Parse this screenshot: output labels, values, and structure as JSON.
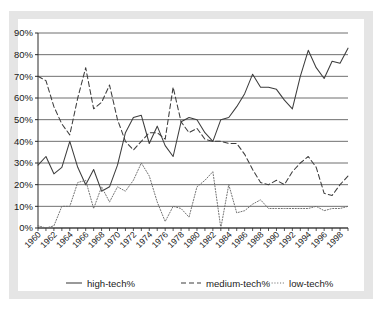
{
  "chart_data": {
    "type": "line",
    "title": "",
    "xlabel": "",
    "ylabel": "",
    "xlim": [
      1960,
      1999
    ],
    "ylim": [
      0,
      90
    ],
    "grid": true,
    "legend_position": "bottom",
    "ytick_labels": [
      "0%",
      "10%",
      "20%",
      "30%",
      "40%",
      "50%",
      "60%",
      "70%",
      "80%",
      "90%"
    ],
    "ytick_values": [
      0,
      10,
      20,
      30,
      40,
      50,
      60,
      70,
      80,
      90
    ],
    "xtick_labels": [
      "1960",
      "1962",
      "1964",
      "1966",
      "1968",
      "1970",
      "1972",
      "1974",
      "1976",
      "1978",
      "1980",
      "1982",
      "1984",
      "1986",
      "1988",
      "1990",
      "1992",
      "1994",
      "1996",
      "1998"
    ],
    "xtick_values": [
      1960,
      1962,
      1964,
      1966,
      1968,
      1970,
      1972,
      1974,
      1976,
      1978,
      1980,
      1982,
      1984,
      1986,
      1988,
      1990,
      1992,
      1994,
      1996,
      1998
    ],
    "x": [
      1960,
      1961,
      1962,
      1963,
      1964,
      1965,
      1966,
      1967,
      1968,
      1969,
      1970,
      1971,
      1972,
      1973,
      1974,
      1975,
      1976,
      1977,
      1978,
      1979,
      1980,
      1981,
      1982,
      1983,
      1984,
      1985,
      1986,
      1987,
      1988,
      1989,
      1990,
      1991,
      1992,
      1993,
      1994,
      1995,
      1996,
      1997,
      1998,
      1999
    ],
    "series": [
      {
        "name": "high-tech%",
        "style": "solid",
        "color": "#3d3d3d",
        "values": [
          29,
          33,
          25,
          28,
          40,
          28,
          20,
          27,
          17,
          19,
          29,
          44,
          51,
          52,
          39,
          47,
          38,
          49,
          51,
          50,
          44,
          40,
          33,
          33,
          45,
          51,
          51,
          52,
          61,
          71,
          65,
          65,
          65,
          64,
          59,
          55,
          82,
          74,
          69,
          77
        ]
      },
      {
        "name": "medium-tech%",
        "style": "dashed",
        "color": "#3d3d3d",
        "values": [
          70,
          71,
          66,
          49,
          42,
          44,
          74,
          62,
          55,
          67,
          58,
          43,
          40,
          45,
          36,
          41,
          39,
          45,
          46,
          41,
          45,
          65,
          51,
          49,
          45,
          42,
          44,
          41,
          42,
          40,
          40,
          40,
          39,
          40,
          27,
          20,
          20,
          19,
          21,
          25
        ]
      },
      {
        "name": "low-tech%",
        "style": "dotted",
        "color": "#6a6a6a",
        "values": [
          1,
          0,
          1,
          10,
          10,
          21,
          22,
          9,
          19,
          12,
          19,
          17,
          22,
          30,
          24,
          12,
          3,
          10,
          9,
          5,
          19,
          22,
          26,
          0,
          20,
          7,
          8,
          11,
          13,
          9,
          9,
          9,
          9,
          9,
          9,
          10,
          8,
          9,
          9,
          10
        ]
      }
    ],
    "series_full": {
      "high-tech%": [
        {
          "x": 1960,
          "y": 29
        },
        {
          "x": 1961,
          "y": 33
        },
        {
          "x": 1962,
          "y": 25
        },
        {
          "x": 1963,
          "y": 28
        },
        {
          "x": 1964,
          "y": 40
        },
        {
          "x": 1965,
          "y": 28
        },
        {
          "x": 1966,
          "y": 20
        },
        {
          "x": 1967,
          "y": 27
        },
        {
          "x": 1968,
          "y": 17
        },
        {
          "x": 1969,
          "y": 19
        },
        {
          "x": 1970,
          "y": 29
        },
        {
          "x": 1971,
          "y": 44
        },
        {
          "x": 1972,
          "y": 51
        },
        {
          "x": 1973,
          "y": 52
        },
        {
          "x": 1974,
          "y": 39
        },
        {
          "x": 1975,
          "y": 47
        },
        {
          "x": 1976,
          "y": 38
        },
        {
          "x": 1977,
          "y": 33
        },
        {
          "x": 1978,
          "y": 49
        },
        {
          "x": 1979,
          "y": 51
        },
        {
          "x": 1980,
          "y": 50
        },
        {
          "x": 1981,
          "y": 44
        },
        {
          "x": 1982,
          "y": 40
        },
        {
          "x": 1983,
          "y": 50
        },
        {
          "x": 1984,
          "y": 51
        },
        {
          "x": 1985,
          "y": 56
        },
        {
          "x": 1986,
          "y": 62
        },
        {
          "x": 1987,
          "y": 71
        },
        {
          "x": 1988,
          "y": 65
        },
        {
          "x": 1989,
          "y": 65
        },
        {
          "x": 1990,
          "y": 64
        },
        {
          "x": 1991,
          "y": 59
        },
        {
          "x": 1992,
          "y": 55
        },
        {
          "x": 1993,
          "y": 70
        },
        {
          "x": 1994,
          "y": 82
        },
        {
          "x": 1995,
          "y": 74
        },
        {
          "x": 1996,
          "y": 69
        },
        {
          "x": 1997,
          "y": 77
        },
        {
          "x": 1998,
          "y": 76
        },
        {
          "x": 1999,
          "y": 83
        }
      ],
      "medium-tech%": [
        {
          "x": 1960,
          "y": 70
        },
        {
          "x": 1961,
          "y": 68
        },
        {
          "x": 1962,
          "y": 56
        },
        {
          "x": 1963,
          "y": 48
        },
        {
          "x": 1964,
          "y": 43
        },
        {
          "x": 1965,
          "y": 60
        },
        {
          "x": 1966,
          "y": 74
        },
        {
          "x": 1967,
          "y": 55
        },
        {
          "x": 1968,
          "y": 58
        },
        {
          "x": 1969,
          "y": 66
        },
        {
          "x": 1970,
          "y": 50
        },
        {
          "x": 1971,
          "y": 40
        },
        {
          "x": 1972,
          "y": 36
        },
        {
          "x": 1973,
          "y": 40
        },
        {
          "x": 1974,
          "y": 44
        },
        {
          "x": 1975,
          "y": 44
        },
        {
          "x": 1976,
          "y": 41
        },
        {
          "x": 1977,
          "y": 65
        },
        {
          "x": 1978,
          "y": 49
        },
        {
          "x": 1979,
          "y": 44
        },
        {
          "x": 1980,
          "y": 46
        },
        {
          "x": 1981,
          "y": 41
        },
        {
          "x": 1982,
          "y": 40
        },
        {
          "x": 1983,
          "y": 40
        },
        {
          "x": 1984,
          "y": 39
        },
        {
          "x": 1985,
          "y": 39
        },
        {
          "x": 1986,
          "y": 34
        },
        {
          "x": 1987,
          "y": 27
        },
        {
          "x": 1988,
          "y": 21
        },
        {
          "x": 1989,
          "y": 20
        },
        {
          "x": 1990,
          "y": 22
        },
        {
          "x": 1991,
          "y": 20
        },
        {
          "x": 1992,
          "y": 26
        },
        {
          "x": 1993,
          "y": 30
        },
        {
          "x": 1994,
          "y": 33
        },
        {
          "x": 1995,
          "y": 28
        },
        {
          "x": 1996,
          "y": 16
        },
        {
          "x": 1997,
          "y": 15
        },
        {
          "x": 1998,
          "y": 20
        },
        {
          "x": 1999,
          "y": 24
        }
      ],
      "low-tech%": [
        {
          "x": 1960,
          "y": 1
        },
        {
          "x": 1961,
          "y": 0
        },
        {
          "x": 1962,
          "y": 1
        },
        {
          "x": 1963,
          "y": 10
        },
        {
          "x": 1964,
          "y": 10
        },
        {
          "x": 1965,
          "y": 21
        },
        {
          "x": 1966,
          "y": 22
        },
        {
          "x": 1967,
          "y": 9
        },
        {
          "x": 1968,
          "y": 19
        },
        {
          "x": 1969,
          "y": 12
        },
        {
          "x": 1970,
          "y": 19
        },
        {
          "x": 1971,
          "y": 17
        },
        {
          "x": 1972,
          "y": 22
        },
        {
          "x": 1973,
          "y": 30
        },
        {
          "x": 1974,
          "y": 24
        },
        {
          "x": 1975,
          "y": 12
        },
        {
          "x": 1976,
          "y": 3
        },
        {
          "x": 1977,
          "y": 10
        },
        {
          "x": 1978,
          "y": 9
        },
        {
          "x": 1979,
          "y": 5
        },
        {
          "x": 1980,
          "y": 19
        },
        {
          "x": 1981,
          "y": 22
        },
        {
          "x": 1982,
          "y": 26
        },
        {
          "x": 1983,
          "y": 0
        },
        {
          "x": 1984,
          "y": 20
        },
        {
          "x": 1985,
          "y": 7
        },
        {
          "x": 1986,
          "y": 8
        },
        {
          "x": 1987,
          "y": 11
        },
        {
          "x": 1988,
          "y": 13
        },
        {
          "x": 1989,
          "y": 9
        },
        {
          "x": 1990,
          "y": 9
        },
        {
          "x": 1991,
          "y": 9
        },
        {
          "x": 1992,
          "y": 9
        },
        {
          "x": 1993,
          "y": 9
        },
        {
          "x": 1994,
          "y": 9
        },
        {
          "x": 1995,
          "y": 10
        },
        {
          "x": 1996,
          "y": 8
        },
        {
          "x": 1997,
          "y": 9
        },
        {
          "x": 1998,
          "y": 9
        },
        {
          "x": 1999,
          "y": 10
        }
      ]
    }
  },
  "legend": {
    "items": [
      {
        "label": "high-tech%",
        "style": "solid"
      },
      {
        "label": "medium-tech%",
        "style": "dashed"
      },
      {
        "label": "low-tech%",
        "style": "dotted"
      }
    ]
  }
}
